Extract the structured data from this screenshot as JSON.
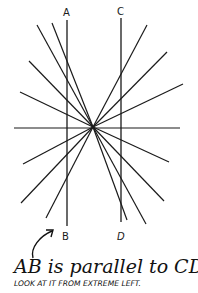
{
  "illusion": {
    "name": "Zollner-style parallel line illusion",
    "labels": {
      "a": "A",
      "b": "B",
      "c": "C",
      "d": "D"
    },
    "caption": "AB is parallel to CD.",
    "subcaption": "LOOK AT IT FROM EXTREME LEFT.",
    "line_color": "#1a1a1a",
    "center": [
      93,
      127
    ],
    "parallel_lines": [
      {
        "name": "AB",
        "x": 67,
        "y1": 20,
        "y2": 226
      },
      {
        "name": "CD",
        "x": 121,
        "y1": 18,
        "y2": 222
      }
    ],
    "radial_endpoints": [
      [
        37,
        25
      ],
      [
        52,
        23
      ],
      [
        29,
        61
      ],
      [
        20,
        92
      ],
      [
        147,
        25
      ],
      [
        167,
        52
      ],
      [
        183,
        84
      ],
      [
        23,
        164
      ],
      [
        21,
        203
      ],
      [
        46,
        218
      ],
      [
        169,
        162
      ],
      [
        164,
        201
      ],
      [
        146,
        224
      ],
      [
        127,
        220
      ]
    ],
    "horizontal": {
      "x1": 14,
      "x2": 180,
      "y": 128
    }
  }
}
